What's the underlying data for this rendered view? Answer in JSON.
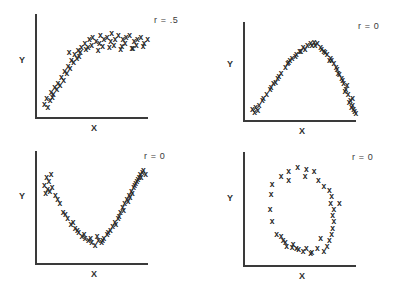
{
  "figure": {
    "title": "",
    "panel_count": 4,
    "marker_glyph": "x"
  },
  "chart_data": [
    {
      "type": "scatter",
      "id": "panel-top-left",
      "title": "",
      "annotation": "r = .5",
      "xlabel": "X",
      "ylabel": "Y",
      "xlim": [
        0,
        100
      ],
      "ylim": [
        0,
        100
      ],
      "grid": false,
      "legend": null,
      "description": "logarithmic / saturating rise then plateau",
      "x": [
        6,
        4,
        10,
        9,
        7,
        13,
        12,
        16,
        15,
        11,
        19,
        18,
        22,
        21,
        25,
        24,
        28,
        27,
        31,
        30,
        34,
        33,
        37,
        36,
        40,
        44,
        43,
        47,
        46,
        50,
        54,
        53,
        57,
        56,
        60,
        64,
        63,
        67,
        66,
        70,
        74,
        73,
        77,
        76,
        80,
        84,
        83,
        87,
        86,
        90,
        93,
        96,
        41,
        52,
        62,
        72,
        82,
        92,
        26,
        35
      ],
      "y": [
        18,
        12,
        24,
        16,
        8,
        30,
        22,
        34,
        27,
        19,
        40,
        32,
        46,
        37,
        52,
        44,
        58,
        50,
        64,
        56,
        68,
        60,
        72,
        66,
        76,
        80,
        72,
        82,
        74,
        78,
        84,
        76,
        80,
        73,
        82,
        86,
        78,
        80,
        74,
        84,
        80,
        73,
        82,
        76,
        84,
        78,
        71,
        80,
        74,
        82,
        76,
        80,
        70,
        68,
        72,
        70,
        71,
        73,
        66,
        62
      ]
    },
    {
      "type": "scatter",
      "id": "panel-top-right",
      "title": "",
      "annotation": "r = 0",
      "xlabel": "X",
      "ylabel": "Y",
      "xlim": [
        0,
        100
      ],
      "ylim": [
        0,
        100
      ],
      "grid": false,
      "legend": null,
      "description": "inverted-U / quadratic curve peaking mid-range",
      "x": [
        4,
        7,
        10,
        9,
        6,
        14,
        17,
        13,
        20,
        23,
        21,
        27,
        30,
        28,
        34,
        37,
        40,
        36,
        44,
        47,
        43,
        50,
        54,
        52,
        57,
        60,
        63,
        61,
        66,
        69,
        72,
        70,
        75,
        78,
        76,
        80,
        82,
        85,
        83,
        87,
        89,
        91,
        88,
        93,
        95,
        92,
        96,
        94,
        97,
        98,
        95,
        90,
        86,
        81,
        74,
        67,
        58,
        48,
        38,
        25
      ],
      "y": [
        10,
        12,
        14,
        9,
        7,
        22,
        26,
        20,
        32,
        38,
        34,
        44,
        50,
        46,
        56,
        62,
        66,
        60,
        70,
        74,
        68,
        78,
        80,
        76,
        82,
        84,
        82,
        80,
        78,
        74,
        70,
        72,
        66,
        60,
        64,
        56,
        50,
        44,
        48,
        38,
        32,
        26,
        30,
        20,
        14,
        18,
        10,
        12,
        8,
        6,
        22,
        36,
        42,
        54,
        64,
        76,
        80,
        74,
        64,
        40
      ]
    },
    {
      "type": "scatter",
      "id": "panel-bottom-left",
      "title": "",
      "annotation": "r = 0",
      "xlabel": "X",
      "ylabel": "Y",
      "xlim": [
        0,
        100
      ],
      "ylim": [
        0,
        100
      ],
      "grid": false,
      "legend": null,
      "description": "U-shaped / parabolic curve with minimum near center",
      "x": [
        6,
        10,
        8,
        4,
        7,
        11,
        5,
        9,
        14,
        18,
        16,
        21,
        25,
        23,
        28,
        32,
        30,
        35,
        38,
        34,
        41,
        44,
        40,
        47,
        50,
        46,
        53,
        56,
        52,
        58,
        61,
        57,
        64,
        66,
        62,
        68,
        71,
        69,
        73,
        75,
        72,
        77,
        79,
        76,
        81,
        83,
        80,
        85,
        87,
        84,
        88,
        90,
        86,
        91,
        93,
        89,
        94,
        96,
        92,
        82
      ],
      "y": [
        82,
        84,
        78,
        74,
        70,
        72,
        66,
        68,
        64,
        56,
        60,
        48,
        42,
        46,
        36,
        32,
        38,
        28,
        24,
        30,
        22,
        20,
        26,
        18,
        16,
        22,
        20,
        18,
        24,
        22,
        26,
        20,
        30,
        34,
        28,
        38,
        42,
        36,
        48,
        52,
        44,
        56,
        60,
        50,
        64,
        68,
        58,
        72,
        76,
        66,
        78,
        82,
        74,
        84,
        86,
        80,
        88,
        84,
        82,
        62
      ]
    },
    {
      "type": "scatter",
      "id": "panel-bottom-right",
      "title": "",
      "annotation": "r = 0",
      "xlabel": "X",
      "ylabel": "Y",
      "xlim": [
        0,
        100
      ],
      "ylim": [
        0,
        100
      ],
      "grid": false,
      "legend": null,
      "description": "points arranged in a ring / circular cloud",
      "x": [
        30,
        37,
        37,
        45,
        53,
        52,
        60,
        64,
        69,
        22,
        74,
        76,
        75,
        78,
        83,
        77,
        78,
        77,
        76,
        74,
        72,
        69,
        63,
        57,
        50,
        44,
        41,
        35,
        32,
        30,
        21,
        20,
        22,
        26,
        46,
        58,
        66,
        34,
        40,
        53
      ],
      "y": [
        84,
        88,
        80,
        92,
        90,
        84,
        88,
        80,
        74,
        76,
        70,
        64,
        58,
        52,
        58,
        46,
        40,
        34,
        28,
        22,
        16,
        12,
        14,
        10,
        12,
        14,
        18,
        16,
        22,
        26,
        66,
        52,
        40,
        28,
        13,
        11,
        24,
        20,
        15,
        14
      ]
    }
  ]
}
